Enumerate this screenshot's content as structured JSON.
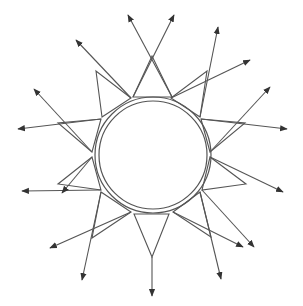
{
  "title": "Sun diagram with triangular rays and outward arrows",
  "colors": {
    "stroke": "#555555",
    "background": "#ffffff"
  },
  "circle": {
    "center": [
      153,
      155
    ],
    "inner_radius": 54,
    "outer_radius": 58
  },
  "triangles": [
    {
      "name": "top",
      "base": [
        [
          133,
          97
        ],
        [
          172,
          97
        ]
      ],
      "apex": [
        152,
        56
      ]
    },
    {
      "name": "upper-right",
      "base": [
        [
          171,
          98
        ],
        [
          200,
          117
        ]
      ],
      "apex": [
        207,
        71
      ]
    },
    {
      "name": "right-upper",
      "base": [
        [
          201,
          119
        ],
        [
          210,
          152
        ]
      ],
      "apex": [
        245,
        123
      ]
    },
    {
      "name": "right-lower",
      "base": [
        [
          210,
          157
        ],
        [
          202,
          190
        ]
      ],
      "apex": [
        246,
        184
      ]
    },
    {
      "name": "lower-right",
      "base": [
        [
          200,
          192
        ],
        [
          173,
          212
        ]
      ],
      "apex": [
        211,
        237
      ]
    },
    {
      "name": "bottom",
      "base": [
        [
          134,
          214
        ],
        [
          169,
          214
        ]
      ],
      "apex": [
        152,
        257
      ]
    },
    {
      "name": "lower-left",
      "base": [
        [
          131,
          212
        ],
        [
          101,
          192
        ]
      ],
      "apex": [
        92,
        238
      ]
    },
    {
      "name": "left-lower",
      "base": [
        [
          101,
          190
        ],
        [
          92,
          157
        ]
      ],
      "apex": [
        58,
        184
      ]
    },
    {
      "name": "left-upper",
      "base": [
        [
          92,
          152
        ],
        [
          101,
          119
        ]
      ],
      "apex": [
        58,
        123
      ]
    },
    {
      "name": "upper-left",
      "base": [
        [
          102,
          117
        ],
        [
          131,
          98
        ]
      ],
      "apex": [
        96,
        71
      ]
    }
  ],
  "arrows": [
    {
      "from": [
        172,
        97
      ],
      "to": [
        128,
        15
      ]
    },
    {
      "from": [
        133,
        97
      ],
      "to": [
        174,
        15
      ]
    },
    {
      "from": [
        171,
        98
      ],
      "to": [
        250,
        60
      ]
    },
    {
      "from": [
        200,
        117
      ],
      "to": [
        218,
        27
      ]
    },
    {
      "from": [
        210,
        152
      ],
      "to": [
        270,
        87
      ]
    },
    {
      "from": [
        201,
        119
      ],
      "to": [
        287,
        129
      ]
    },
    {
      "from": [
        210,
        157
      ],
      "to": [
        283,
        192
      ]
    },
    {
      "from": [
        202,
        190
      ],
      "to": [
        254,
        247
      ]
    },
    {
      "from": [
        200,
        192
      ],
      "to": [
        221,
        279
      ]
    },
    {
      "from": [
        173,
        212
      ],
      "to": [
        243,
        247
      ]
    },
    {
      "from": [
        152,
        257
      ],
      "to": [
        152,
        296
      ]
    },
    {
      "from": [
        131,
        212
      ],
      "to": [
        50,
        248
      ]
    },
    {
      "from": [
        101,
        192
      ],
      "to": [
        82,
        280
      ]
    },
    {
      "from": [
        101,
        190
      ],
      "to": [
        22,
        191
      ]
    },
    {
      "from": [
        92,
        157
      ],
      "to": [
        62,
        193
      ]
    },
    {
      "from": [
        101,
        119
      ],
      "to": [
        18,
        129
      ]
    },
    {
      "from": [
        92,
        152
      ],
      "to": [
        34,
        89
      ]
    },
    {
      "from": [
        131,
        98
      ],
      "to": [
        76,
        40
      ]
    }
  ]
}
